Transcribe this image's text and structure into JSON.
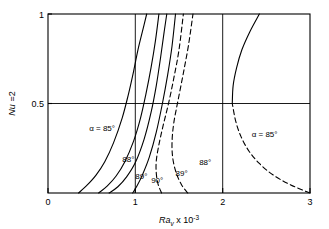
{
  "chart_data": {
    "type": "line",
    "title": "",
    "xlabel": "Ra_v x 10^-3",
    "ylabel": "Nu = 2",
    "xlim": [
      0,
      3
    ],
    "ylim": [
      0,
      1
    ],
    "xticks": [
      "0",
      "1",
      "2",
      "3"
    ],
    "xtick_values": [
      0,
      1,
      2,
      3
    ],
    "yticks": [
      "0.5",
      "1"
    ],
    "ytick_values": [
      0.5,
      1
    ],
    "grid": "gridlines at x=1, x=2 and y=0.5",
    "legend_position": "inline curve labels",
    "series": [
      {
        "name": "alpha = 85 deg (lower branch)",
        "label": "α = 85°",
        "style": "solid",
        "points": [
          [
            0.35,
            0.0
          ],
          [
            0.45,
            0.045
          ],
          [
            0.55,
            0.1
          ],
          [
            0.65,
            0.175
          ],
          [
            0.75,
            0.28
          ],
          [
            0.85,
            0.42
          ],
          [
            0.92,
            0.55
          ],
          [
            0.98,
            0.68
          ],
          [
            1.03,
            0.8
          ],
          [
            1.08,
            0.9
          ],
          [
            1.13,
            1.0
          ]
        ]
      },
      {
        "name": "88 deg (lower branch)",
        "label": "88°",
        "style": "solid",
        "points": [
          [
            0.58,
            0.0
          ],
          [
            0.68,
            0.04
          ],
          [
            0.78,
            0.095
          ],
          [
            0.88,
            0.175
          ],
          [
            0.98,
            0.29
          ],
          [
            1.06,
            0.42
          ],
          [
            1.12,
            0.55
          ],
          [
            1.18,
            0.7
          ],
          [
            1.23,
            0.85
          ],
          [
            1.27,
            1.0
          ]
        ]
      },
      {
        "name": "89 deg (lower branch)",
        "label": "89°",
        "style": "solid",
        "points": [
          [
            0.7,
            0.0
          ],
          [
            0.8,
            0.035
          ],
          [
            0.9,
            0.09
          ],
          [
            1.0,
            0.17
          ],
          [
            1.1,
            0.3
          ],
          [
            1.18,
            0.45
          ],
          [
            1.24,
            0.6
          ],
          [
            1.29,
            0.76
          ],
          [
            1.33,
            0.9
          ],
          [
            1.36,
            1.0
          ]
        ]
      },
      {
        "name": "90 deg",
        "label": "90°",
        "style": "solid",
        "points": [
          [
            0.97,
            0.0
          ],
          [
            1.02,
            0.04
          ],
          [
            1.08,
            0.1
          ],
          [
            1.16,
            0.2
          ],
          [
            1.24,
            0.34
          ],
          [
            1.31,
            0.5
          ],
          [
            1.37,
            0.66
          ],
          [
            1.42,
            0.82
          ],
          [
            1.46,
            1.0
          ]
        ]
      },
      {
        "name": "89 deg (upper branch)",
        "label": "89°",
        "style": "dashed",
        "points": [
          [
            1.3,
            0.0
          ],
          [
            1.26,
            0.05
          ],
          [
            1.24,
            0.11
          ],
          [
            1.24,
            0.18
          ],
          [
            1.27,
            0.27
          ],
          [
            1.32,
            0.38
          ],
          [
            1.38,
            0.5
          ],
          [
            1.44,
            0.64
          ],
          [
            1.5,
            0.8
          ],
          [
            1.55,
            1.0
          ]
        ]
      },
      {
        "name": "88 deg (upper branch)",
        "label": "88°",
        "style": "dashed",
        "points": [
          [
            1.6,
            0.0
          ],
          [
            1.53,
            0.045
          ],
          [
            1.47,
            0.11
          ],
          [
            1.43,
            0.19
          ],
          [
            1.42,
            0.28
          ],
          [
            1.44,
            0.39
          ],
          [
            1.49,
            0.52
          ],
          [
            1.55,
            0.67
          ],
          [
            1.61,
            0.83
          ],
          [
            1.66,
            1.0
          ]
        ]
      },
      {
        "name": "alpha = 85 deg (upper branch, dashed)",
        "label": "α = 85°",
        "style": "dashed",
        "points": [
          [
            3.0,
            0.0
          ],
          [
            2.78,
            0.045
          ],
          [
            2.58,
            0.1
          ],
          [
            2.42,
            0.165
          ],
          [
            2.3,
            0.235
          ],
          [
            2.21,
            0.315
          ],
          [
            2.15,
            0.4
          ],
          [
            2.11,
            0.5
          ]
        ]
      },
      {
        "name": "alpha = 85 deg (upper branch, solid)",
        "label": "",
        "style": "solid",
        "points": [
          [
            2.11,
            0.5
          ],
          [
            2.12,
            0.6
          ],
          [
            2.16,
            0.7
          ],
          [
            2.22,
            0.8
          ],
          [
            2.31,
            0.9
          ],
          [
            2.42,
            1.0
          ]
        ]
      }
    ],
    "annotations": [
      {
        "text": "α = 85°",
        "x": 0.62,
        "y": 0.345
      },
      {
        "text": "88°",
        "x": 0.92,
        "y": 0.175
      },
      {
        "text": "89°",
        "x": 1.07,
        "y": 0.078
      },
      {
        "text": "90°",
        "x": 1.25,
        "y": 0.055
      },
      {
        "text": "89°",
        "x": 1.53,
        "y": 0.095
      },
      {
        "text": "88°",
        "x": 1.8,
        "y": 0.155
      },
      {
        "text": "α = 85°",
        "x": 2.48,
        "y": 0.315
      }
    ]
  },
  "axes": {
    "y_label_parts": {
      "nu": "Nu",
      "eq": " =2"
    },
    "x_label_parts": {
      "ra": "Ra",
      "sub": "v",
      "mul": " x 10",
      "exp": "-3"
    },
    "xticks": [
      "0",
      "1",
      "2",
      "3"
    ],
    "yticks": {
      "half": "0.5",
      "one": "1"
    }
  },
  "colors": {
    "line": "#000000",
    "axis": "#000000",
    "background": "#ffffff"
  }
}
